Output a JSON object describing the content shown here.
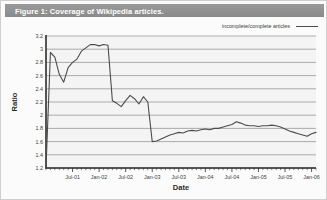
{
  "figure": {
    "title": "Figure 1: Coverage of Wikipedia articles.",
    "frame_color": "#cfcfcf",
    "title_bar_color": "#8f8f8f"
  },
  "legend": {
    "entries": [
      {
        "label": "incomplete/complete articles",
        "color": "#4c4c4c",
        "marker": "line-swatch"
      }
    ],
    "position": "top-right"
  },
  "chart_data": {
    "type": "line",
    "title": "Figure 1: Coverage of Wikipedia articles.",
    "xlabel": "Date",
    "ylabel": "Ratio",
    "ylim": [
      1.2,
      3.2
    ],
    "ytick_step": 0.2,
    "ytick_labels": [
      "1.2",
      "1.4",
      "1.6",
      "1.8",
      "2",
      "2.2",
      "2.4",
      "2.6",
      "2.8",
      "3",
      "3.2"
    ],
    "xtick_labels": [
      "Jul-01",
      "Jan-02",
      "Jul-02",
      "Jan-03",
      "Jul-03",
      "Jan-04",
      "Jul-04",
      "Jan-05",
      "Jul-05",
      "Jan-06"
    ],
    "xlim": [
      "Jan-01",
      "Jul-06"
    ],
    "grid": "horizontal",
    "minor_xticks": "monthly",
    "series": [
      {
        "name": "incomplete/complete articles",
        "color": "#4c4c4c",
        "x": [
          "Jan-01",
          "Feb-01",
          "Mar-01",
          "Apr-01",
          "May-01",
          "Jun-01",
          "Jul-01",
          "Aug-01",
          "Sep-01",
          "Oct-01",
          "Nov-01",
          "Dec-01",
          "Jan-02",
          "Feb-02",
          "Mar-02",
          "Apr-02",
          "May-02",
          "Jun-02",
          "Jul-02",
          "Aug-02",
          "Sep-02",
          "Oct-02",
          "Nov-02",
          "Dec-02",
          "Jan-03",
          "Feb-03",
          "Mar-03",
          "Apr-03",
          "May-03",
          "Jun-03",
          "Jul-03",
          "Aug-03",
          "Sep-03",
          "Oct-03",
          "Nov-03",
          "Dec-03",
          "Jan-04",
          "Feb-04",
          "Mar-04",
          "Apr-04",
          "May-04",
          "Jun-04",
          "Jul-04",
          "Aug-04",
          "Sep-04",
          "Oct-04",
          "Nov-04",
          "Dec-04",
          "Jan-05",
          "Feb-05",
          "Mar-05",
          "Apr-05",
          "May-05",
          "Jun-05",
          "Jul-05",
          "Aug-05",
          "Sep-05",
          "Oct-05",
          "Nov-05",
          "Dec-05",
          "Jan-06",
          "Feb-06"
        ],
        "values": [
          1.2,
          2.95,
          2.88,
          2.62,
          2.5,
          2.72,
          2.8,
          2.85,
          2.97,
          3.02,
          3.07,
          3.07,
          3.05,
          3.07,
          3.06,
          2.22,
          2.18,
          2.13,
          2.22,
          2.3,
          2.25,
          2.17,
          2.28,
          2.2,
          1.6,
          1.61,
          1.64,
          1.67,
          1.7,
          1.72,
          1.74,
          1.73,
          1.76,
          1.77,
          1.76,
          1.78,
          1.79,
          1.78,
          1.8,
          1.8,
          1.82,
          1.84,
          1.86,
          1.9,
          1.88,
          1.85,
          1.84,
          1.84,
          1.83,
          1.84,
          1.84,
          1.85,
          1.84,
          1.82,
          1.79,
          1.76,
          1.74,
          1.72,
          1.7,
          1.68,
          1.72,
          1.74
        ]
      }
    ]
  }
}
